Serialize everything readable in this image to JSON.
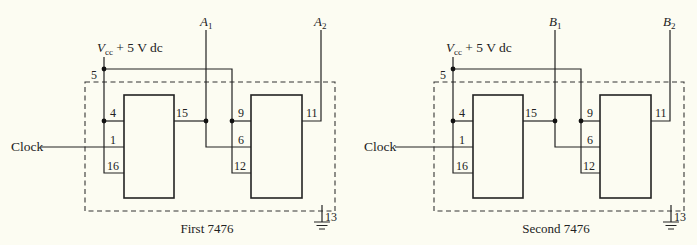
{
  "diagram": {
    "type": "circuit-schematic",
    "background": "#fcfcf2",
    "line_color": "#222222",
    "circuits": [
      {
        "id": "first",
        "caption": "First 7476",
        "supply_label": "V",
        "supply_sub": "cc",
        "supply_value": " + 5 V dc",
        "supply_pin": "5",
        "clock_label": "Clock",
        "outputs": [
          {
            "name": "A",
            "sub": "1"
          },
          {
            "name": "A",
            "sub": "2"
          }
        ],
        "ff1_pins": {
          "preset": "4",
          "clock": "1",
          "clear": "16",
          "q": "15"
        },
        "ff2_pins": {
          "preset": "9",
          "clock": "6",
          "clear": "12",
          "q": "11"
        },
        "ground_pin": "13"
      },
      {
        "id": "second",
        "caption": "Second 7476",
        "supply_label": "V",
        "supply_sub": "cc",
        "supply_value": " + 5 V dc",
        "supply_pin": "5",
        "clock_label": "Clock",
        "outputs": [
          {
            "name": "B",
            "sub": "1"
          },
          {
            "name": "B",
            "sub": "2"
          }
        ],
        "ff1_pins": {
          "preset": "4",
          "clock": "1",
          "clear": "16",
          "q": "15"
        },
        "ff2_pins": {
          "preset": "9",
          "clock": "6",
          "clear": "12",
          "q": "11"
        },
        "ground_pin": "13"
      }
    ]
  }
}
